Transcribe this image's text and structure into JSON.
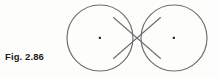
{
  "figure": {
    "caption": "Fig. 2.86",
    "stroke_color": "#6d6d6d",
    "dot_color": "#1d1d1b",
    "background_color": "#fdfdfc",
    "geometry": {
      "left_circle": {
        "cx": 100,
        "cy": 38,
        "r": 33
      },
      "right_circle": {
        "cx": 174,
        "cy": 38,
        "r": 33
      },
      "crossing_point": {
        "x": 137,
        "y": 38
      },
      "tangent_1": {
        "x1": 113.5,
        "y1": 17.5,
        "x2": 160.5,
        "y2": 58.5
      },
      "tangent_2": {
        "x1": 113.5,
        "y1": 58.5,
        "x2": 160.5,
        "y2": 17.5
      },
      "stroke_width": 1.1
    }
  }
}
